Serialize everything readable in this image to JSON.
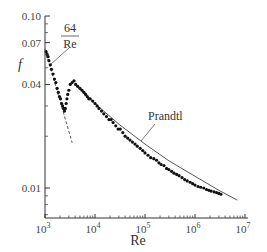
{
  "chart_data": {
    "type": "scatter",
    "title": "",
    "xlabel": "Re",
    "ylabel": "f",
    "xscale": "log",
    "yscale": "log",
    "xlim": [
      1000,
      10000000
    ],
    "ylim": [
      0.0067,
      0.1
    ],
    "grid": false,
    "x_ticks": [
      {
        "value": 1000,
        "label": "10",
        "exp": "3"
      },
      {
        "value": 10000,
        "label": "10",
        "exp": "4"
      },
      {
        "value": 100000,
        "label": "10",
        "exp": "5"
      },
      {
        "value": 1000000,
        "label": "10",
        "exp": "6"
      },
      {
        "value": 10000000,
        "label": "10",
        "exp": "7"
      }
    ],
    "y_ticks": [
      {
        "value": 0.1,
        "label": "0.10"
      },
      {
        "value": 0.07,
        "label": "0.07"
      },
      {
        "value": 0.04,
        "label": "0.04"
      },
      {
        "value": 0.01,
        "label": "0.01"
      }
    ],
    "annotations": [
      {
        "text_num": "64",
        "text_den": "Re",
        "label": "64/Re",
        "curve": "laminar"
      },
      {
        "text": "Prandtl",
        "curve": "turbulent"
      }
    ],
    "series": [
      {
        "name": "64/Re (laminar)",
        "style": "dashed-line",
        "x": [
          1000,
          3500
        ],
        "y": [
          0.064,
          0.0183
        ]
      },
      {
        "name": "Prandtl (turbulent)",
        "style": "solid-line",
        "x": [
          4000,
          10000,
          30000,
          100000,
          300000,
          1000000,
          3000000,
          7000000
        ],
        "y": [
          0.04,
          0.031,
          0.0235,
          0.018,
          0.0144,
          0.0117,
          0.0097,
          0.0085
        ]
      },
      {
        "name": "Experimental data",
        "style": "markers",
        "x": [
          1050,
          1100,
          1150,
          1200,
          1280,
          1350,
          1450,
          1550,
          1650,
          1750,
          1850,
          1950,
          2050,
          2150,
          2250,
          2350,
          2450,
          2550,
          2650,
          2750,
          2850,
          3000,
          3200,
          3500,
          3800,
          4100,
          4500,
          5000,
          5500,
          6000,
          6500,
          7000,
          7500,
          8000,
          9000,
          10000,
          11000,
          12000,
          13500,
          15000,
          17000,
          19000,
          21000,
          23000,
          26000,
          29000,
          32000,
          36000,
          40000,
          45000,
          50000,
          56000,
          63000,
          70000,
          80000,
          90000,
          100000,
          115000,
          130000,
          150000,
          170000,
          190000,
          210000,
          240000,
          270000,
          300000,
          340000,
          380000,
          430000,
          480000,
          550000,
          620000,
          700000,
          800000,
          900000,
          1000000,
          1150000,
          1300000,
          1500000,
          1700000,
          1900000,
          2100000,
          2400000,
          2700000,
          3000000,
          3300000
        ],
        "y": [
          0.062,
          0.06,
          0.058,
          0.055,
          0.052,
          0.049,
          0.046,
          0.043,
          0.041,
          0.038,
          0.036,
          0.034,
          0.033,
          0.031,
          0.03,
          0.029,
          0.028,
          0.029,
          0.031,
          0.033,
          0.035,
          0.037,
          0.04,
          0.041,
          0.042,
          0.04,
          0.039,
          0.038,
          0.037,
          0.036,
          0.035,
          0.034,
          0.033,
          0.033,
          0.032,
          0.031,
          0.03,
          0.029,
          0.028,
          0.027,
          0.026,
          0.025,
          0.025,
          0.024,
          0.023,
          0.022,
          0.022,
          0.021,
          0.02,
          0.0195,
          0.019,
          0.0185,
          0.018,
          0.0175,
          0.017,
          0.0165,
          0.016,
          0.0155,
          0.015,
          0.0148,
          0.0145,
          0.014,
          0.0137,
          0.0135,
          0.013,
          0.0128,
          0.0125,
          0.0122,
          0.012,
          0.0118,
          0.0115,
          0.0112,
          0.011,
          0.0108,
          0.0106,
          0.0104,
          0.0102,
          0.0101,
          0.01,
          0.0098,
          0.0097,
          0.0096,
          0.0095,
          0.0094,
          0.0093,
          0.0092
        ]
      }
    ]
  }
}
